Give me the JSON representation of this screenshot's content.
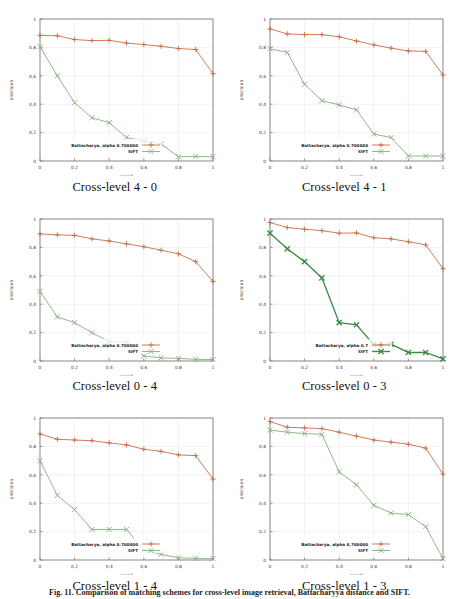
{
  "figure": {
    "caption": "Fig. 11. Comparison of matching schemes for cross-level image retrieval, Battacharyya distance and SIFT.",
    "colors": {
      "series1": "#c4673c",
      "series2": "#7fa978",
      "series2_bold": "#3f8a46",
      "axis": "#555555",
      "grid": "#ededed",
      "frame": "#808080"
    },
    "axis": {
      "xlabel": "recall",
      "ylabel": "precision",
      "xticks": [
        "0",
        "0,2",
        "0,4",
        "0,6",
        "0,8",
        "1"
      ],
      "yticks": [
        "0",
        "0,2",
        "0,4",
        "0,6",
        "0,8",
        "1"
      ],
      "xlim": [
        0,
        1
      ],
      "ylim": [
        0,
        1
      ]
    }
  },
  "chart_data": [
    {
      "type": "line",
      "title": "Cross-level 4 - 0",
      "xlabel": "recall",
      "ylabel": "precision",
      "xlim": [
        0,
        1
      ],
      "ylim": [
        0,
        1
      ],
      "grid": true,
      "legend_position": "bottom-left",
      "x": [
        0,
        0.1,
        0.2,
        0.3,
        0.4,
        0.5,
        0.6,
        0.7,
        0.8,
        0.9,
        1.0
      ],
      "series": [
        {
          "name": "Battacharya, alpha 0.700000",
          "marker": "+",
          "color": "#c4673c",
          "values": [
            0.885,
            0.882,
            0.855,
            0.848,
            0.85,
            0.83,
            0.82,
            0.808,
            0.792,
            0.785,
            0.615
          ]
        },
        {
          "name": "SIFT",
          "marker": "x",
          "color": "#7fa978",
          "values": [
            0.805,
            0.6,
            0.41,
            0.305,
            0.27,
            0.165,
            0.14,
            0.12,
            0.03,
            0.032,
            0.03
          ]
        }
      ]
    },
    {
      "type": "line",
      "title": "Cross-level 4 - 1",
      "xlabel": "recall",
      "ylabel": "precision",
      "xlim": [
        0,
        1
      ],
      "ylim": [
        0,
        1
      ],
      "grid": true,
      "legend_position": "bottom-left",
      "x": [
        0,
        0.1,
        0.2,
        0.3,
        0.4,
        0.5,
        0.6,
        0.7,
        0.8,
        0.9,
        1.0
      ],
      "series": [
        {
          "name": "Battacharya, alpha 0.700000",
          "marker": "+",
          "color": "#c4673c",
          "values": [
            0.93,
            0.895,
            0.89,
            0.89,
            0.875,
            0.845,
            0.818,
            0.795,
            0.775,
            0.772,
            0.605
          ]
        },
        {
          "name": "SIFT",
          "marker": "x",
          "color": "#7fa978",
          "values": [
            0.79,
            0.765,
            0.54,
            0.425,
            0.395,
            0.36,
            0.19,
            0.165,
            0.035,
            0.035,
            0.035
          ]
        }
      ]
    },
    {
      "type": "line",
      "title": "Cross-level 0 - 4",
      "xlabel": "recall",
      "ylabel": "precision",
      "xlim": [
        0,
        1
      ],
      "ylim": [
        0,
        1
      ],
      "grid": true,
      "legend_position": "bottom-left",
      "x": [
        0,
        0.1,
        0.2,
        0.3,
        0.4,
        0.5,
        0.6,
        0.7,
        0.8,
        0.9,
        1.0
      ],
      "series": [
        {
          "name": "Battacharya, alpha 0.700000",
          "marker": "+",
          "color": "#c4673c",
          "values": [
            0.895,
            0.888,
            0.885,
            0.86,
            0.845,
            0.825,
            0.805,
            0.78,
            0.755,
            0.7,
            0.56
          ]
        },
        {
          "name": "SIFT",
          "marker": "x",
          "color": "#7fa978",
          "values": [
            0.49,
            0.31,
            0.27,
            0.2,
            0.135,
            0.135,
            0.035,
            0.022,
            0.018,
            0.012,
            0.01
          ]
        }
      ]
    },
    {
      "type": "line",
      "title": "Cross-level 0 - 3",
      "xlabel": "recall",
      "ylabel": "precision",
      "xlim": [
        0,
        1
      ],
      "ylim": [
        0,
        1
      ],
      "grid": true,
      "legend_position": "bottom-left",
      "x": [
        0,
        0.1,
        0.2,
        0.3,
        0.4,
        0.5,
        0.6,
        0.7,
        0.8,
        0.9,
        1.0
      ],
      "series": [
        {
          "name": "Battacharya, alpha 0.7",
          "marker": "+",
          "color": "#c4673c",
          "values": [
            0.975,
            0.94,
            0.928,
            0.918,
            0.9,
            0.902,
            0.868,
            0.86,
            0.84,
            0.818,
            0.65
          ]
        },
        {
          "name": "SIFT",
          "marker": "x",
          "color": "#3f8a46",
          "values": [
            0.9,
            0.79,
            0.7,
            0.585,
            0.27,
            0.255,
            0.115,
            0.118,
            0.06,
            0.06,
            0.015
          ]
        }
      ]
    },
    {
      "type": "line",
      "title": "Cross-level 1 - 4",
      "xlabel": "recall",
      "ylabel": "precision",
      "xlim": [
        0,
        1
      ],
      "ylim": [
        0,
        1
      ],
      "grid": true,
      "legend_position": "bottom-left",
      "x": [
        0,
        0.1,
        0.2,
        0.3,
        0.4,
        0.5,
        0.6,
        0.7,
        0.8,
        0.9,
        1.0
      ],
      "series": [
        {
          "name": "Battacharya, alpha 0.700000",
          "marker": "+",
          "color": "#c4673c",
          "values": [
            0.888,
            0.85,
            0.845,
            0.84,
            0.825,
            0.81,
            0.78,
            0.765,
            0.74,
            0.735,
            0.57
          ]
        },
        {
          "name": "SIFT",
          "marker": "x",
          "color": "#7fa978",
          "values": [
            0.7,
            0.455,
            0.355,
            0.215,
            0.215,
            0.215,
            0.07,
            0.04,
            0.015,
            0.012,
            0.01
          ]
        }
      ]
    },
    {
      "type": "line",
      "title": "Cross-level 1 - 3",
      "xlabel": "recall",
      "ylabel": "precision",
      "xlim": [
        0,
        1
      ],
      "ylim": [
        0,
        1
      ],
      "grid": true,
      "legend_position": "bottom-left",
      "x": [
        0,
        0.1,
        0.2,
        0.3,
        0.4,
        0.5,
        0.6,
        0.7,
        0.8,
        0.9,
        1.0
      ],
      "series": [
        {
          "name": "Battacharya, alpha 0.700000",
          "marker": "+",
          "color": "#c4673c",
          "values": [
            0.975,
            0.935,
            0.93,
            0.925,
            0.9,
            0.872,
            0.845,
            0.83,
            0.815,
            0.788,
            0.605
          ]
        },
        {
          "name": "SIFT",
          "marker": "x",
          "color": "#7fa978",
          "values": [
            0.915,
            0.9,
            0.89,
            0.885,
            0.62,
            0.53,
            0.385,
            0.33,
            0.32,
            0.235,
            0.01
          ]
        }
      ]
    }
  ]
}
